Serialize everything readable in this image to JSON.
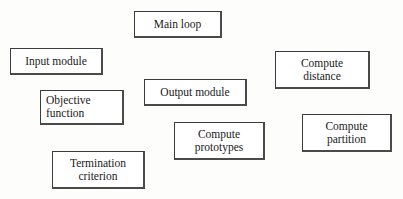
{
  "diagram": {
    "background_color": "#fdfdfb",
    "box_fill_color": "#ffffff",
    "box_border_color": "#3c3c3c",
    "text_color": "#1a1a1a",
    "nodes": [
      {
        "id": "main-loop",
        "label": "Main loop",
        "x": 134,
        "y": 11,
        "w": 88,
        "h": 27,
        "font_size": 11.5,
        "align": "center"
      },
      {
        "id": "input-module",
        "label": "Input module",
        "x": 10,
        "y": 48,
        "w": 93,
        "h": 27,
        "font_size": 11.5,
        "align": "center"
      },
      {
        "id": "compute-distance",
        "label": "Compute\ndistance",
        "x": 275,
        "y": 51,
        "w": 95,
        "h": 38,
        "font_size": 11.5,
        "align": "center"
      },
      {
        "id": "output-module",
        "label": "Output  module",
        "x": 144,
        "y": 79,
        "w": 103,
        "h": 27,
        "font_size": 11.5,
        "align": "center"
      },
      {
        "id": "objective-function",
        "label": "Objective\nfunction",
        "x": 40,
        "y": 90,
        "w": 84,
        "h": 35,
        "font_size": 11.5,
        "align": "left"
      },
      {
        "id": "compute-partition",
        "label": "Compute\npartition",
        "x": 302,
        "y": 114,
        "w": 90,
        "h": 38,
        "font_size": 11.5,
        "align": "center"
      },
      {
        "id": "compute-prototypes",
        "label": "Compute\nprototypes",
        "x": 174,
        "y": 122,
        "w": 91,
        "h": 38,
        "font_size": 11.5,
        "align": "center"
      },
      {
        "id": "termination-criterion",
        "label": "Termination\ncriterion",
        "x": 52,
        "y": 151,
        "w": 93,
        "h": 38,
        "font_size": 11.5,
        "align": "center"
      }
    ]
  }
}
